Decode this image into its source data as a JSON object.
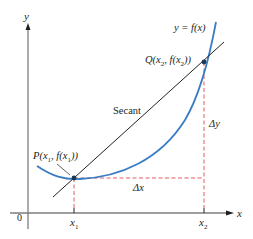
{
  "diagram": {
    "axes": {
      "x_label": "x",
      "y_label": "y",
      "origin_label": "0",
      "x_ticks": [
        {
          "main": "x",
          "sub": "1"
        },
        {
          "main": "x",
          "sub": "2"
        }
      ]
    },
    "curve": {
      "label": "y = f(x)",
      "color": "#3a7cc4"
    },
    "secant": {
      "label": "Secant",
      "color": "#231f20"
    },
    "points": {
      "P": {
        "label": "P(x",
        "sub1": "1",
        "mid": ", f(x",
        "sub2": "1",
        "end": "))"
      },
      "Q": {
        "label": "Q(x",
        "sub1": "2",
        "mid": ", f(x",
        "sub2": "2",
        "end": "))"
      }
    },
    "increments": {
      "dx_label": "Δx",
      "dy_label": "Δy",
      "color": "#e0484d"
    },
    "colors": {
      "axis": "#7d7d7d",
      "curve": "#3a7cc4",
      "secant": "#231f20",
      "dashed": "#e0484d",
      "text": "#231f20"
    }
  }
}
